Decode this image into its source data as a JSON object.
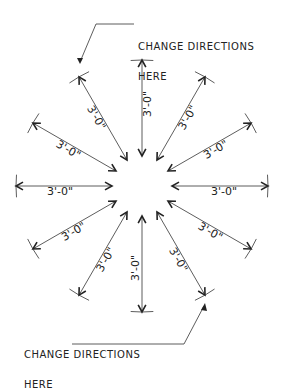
{
  "diagram": {
    "type": "radial-dimension-drawing",
    "center": {
      "x": 142,
      "y": 186
    },
    "inner_radius": 30,
    "outer_radius": 126,
    "line_color": "#333333",
    "dimension_label": "3'-0\"",
    "dimensions": [
      {
        "angle": -90,
        "label": "3'-0\""
      },
      {
        "angle": -60,
        "label": "3'-0\""
      },
      {
        "angle": -30,
        "label": "3'-0\""
      },
      {
        "angle": 0,
        "label": "3'-0\""
      },
      {
        "angle": 30,
        "label": "3'-0\""
      },
      {
        "angle": 60,
        "label": "3'-0\""
      },
      {
        "angle": 90,
        "label": "3'-0\""
      },
      {
        "angle": 120,
        "label": "3'-0\""
      },
      {
        "angle": 150,
        "label": "3'-0\""
      },
      {
        "angle": 180,
        "label": "3'-0\""
      },
      {
        "angle": 210,
        "label": "3'-0\""
      },
      {
        "angle": 240,
        "label": "3'-0\""
      }
    ],
    "notes": {
      "top": {
        "line1": "CHANGE DIRECTIONS",
        "line2": "HERE"
      },
      "bottom": {
        "line1": "CHANGE DIRECTIONS",
        "line2": "HERE"
      }
    }
  }
}
